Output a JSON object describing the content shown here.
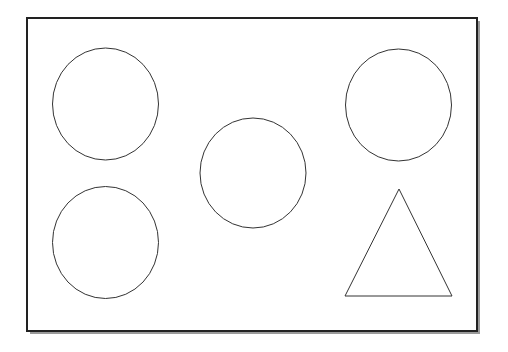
{
  "diagram": {
    "background": "#ffffff",
    "stroke_color": "#333333",
    "frame": {
      "x": 27,
      "y": 18,
      "width": 450,
      "height": 313,
      "stroke": "#222222",
      "stroke_width": 2,
      "shadow_color": "#9a9a9a",
      "shadow_offset": 3
    },
    "shapes": [
      {
        "id": "circle-top-left",
        "type": "ellipse",
        "cx": 105.5,
        "cy": 104,
        "rx": 53,
        "ry": 56
      },
      {
        "id": "circle-top-right",
        "type": "ellipse",
        "cx": 398.5,
        "cy": 105,
        "rx": 53,
        "ry": 56
      },
      {
        "id": "circle-center",
        "type": "ellipse",
        "cx": 253,
        "cy": 173,
        "rx": 53,
        "ry": 55
      },
      {
        "id": "circle-bottom-left",
        "type": "ellipse",
        "cx": 105.5,
        "cy": 242.5,
        "rx": 53,
        "ry": 56
      },
      {
        "id": "triangle-bottom-right",
        "type": "triangle",
        "points": [
          [
            399,
            189
          ],
          [
            452,
            296
          ],
          [
            345,
            296
          ]
        ]
      }
    ]
  }
}
